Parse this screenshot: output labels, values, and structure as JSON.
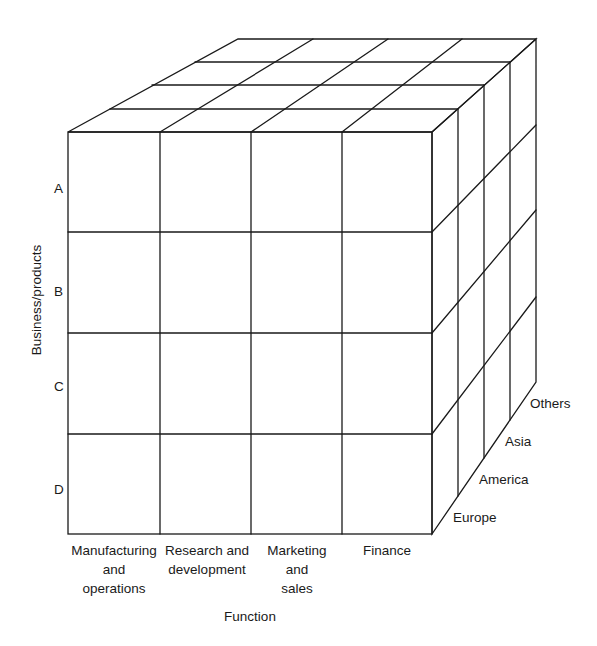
{
  "diagram": {
    "type": "3d-matrix-cube",
    "axes": {
      "vertical": {
        "title": "Business/products",
        "labels": [
          "A",
          "B",
          "C",
          "D"
        ]
      },
      "horizontal": {
        "title": "Function",
        "labels": [
          "Manufacturing\nand\noperations",
          "Research and\ndevelopment",
          "Marketing\nand\nsales",
          "Finance"
        ]
      },
      "depth": {
        "labels": [
          "Europe",
          "America",
          "Asia",
          "Others"
        ]
      }
    },
    "colors": {
      "line": "#1a1a1a",
      "background": "#ffffff"
    }
  }
}
